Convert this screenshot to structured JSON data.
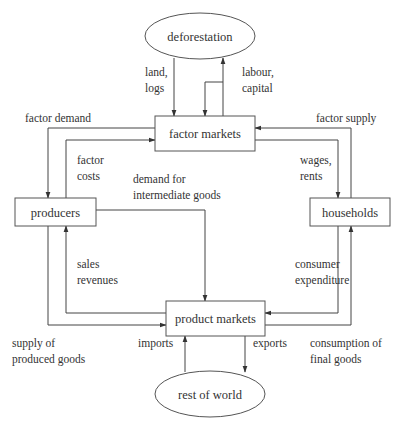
{
  "nodes": {
    "deforestation": {
      "label": "deforestation",
      "shape": "ellipse",
      "cx": 200,
      "cy": 36,
      "rx": 55,
      "ry": 23
    },
    "factor_markets": {
      "label": "factor markets",
      "shape": "rect",
      "x": 155,
      "y": 116,
      "w": 100,
      "h": 35
    },
    "producers": {
      "label": "producers",
      "shape": "rect",
      "x": 15,
      "y": 198,
      "w": 81,
      "h": 28
    },
    "households": {
      "label": "households",
      "shape": "rect",
      "x": 310,
      "y": 198,
      "w": 80,
      "h": 28
    },
    "product_markets": {
      "label": "product markets",
      "shape": "rect",
      "x": 166,
      "y": 301,
      "w": 99,
      "h": 35
    },
    "rest_of_world": {
      "label": "rest of world",
      "shape": "ellipse",
      "cx": 210,
      "cy": 394,
      "rx": 55,
      "ry": 23
    }
  },
  "edges": [
    {
      "id": "land-logs",
      "from": "deforestation",
      "to": "factor_markets",
      "label": [
        "land,",
        "logs"
      ],
      "label_pos": [
        145,
        76
      ],
      "path": [
        [
          174,
          58
        ],
        [
          174,
          116
        ]
      ]
    },
    {
      "id": "labour-capital",
      "from": "factor_markets",
      "to": "deforestation",
      "label": [
        "labour,",
        "capital"
      ],
      "label_pos": [
        242,
        76
      ],
      "path": [
        [
          223,
          116
        ],
        [
          223,
          58
        ]
      ]
    },
    {
      "id": "labour-capital-return",
      "from": "deforestation",
      "to": "factor_markets",
      "label": [],
      "label_pos": [
        0,
        0
      ],
      "path": [
        [
          223,
          82
        ],
        [
          205,
          82
        ],
        [
          205,
          116
        ]
      ]
    },
    {
      "id": "factor-demand",
      "from": "factor_markets",
      "to": "producers",
      "label": [
        "factor demand"
      ],
      "label_pos": [
        25,
        122
      ],
      "path": [
        [
          155,
          128
        ],
        [
          48,
          128
        ],
        [
          48,
          198
        ]
      ]
    },
    {
      "id": "factor-costs",
      "from": "producers",
      "to": "factor_markets",
      "label": [
        "factor",
        "costs"
      ],
      "label_pos": [
        77,
        164
      ],
      "path": [
        [
          66,
          198
        ],
        [
          66,
          140
        ],
        [
          155,
          140
        ]
      ]
    },
    {
      "id": "factor-supply",
      "from": "households",
      "to": "factor_markets",
      "label": [
        "factor supply"
      ],
      "label_pos": [
        316,
        122
      ],
      "path": [
        [
          351,
          198
        ],
        [
          351,
          128
        ],
        [
          255,
          128
        ]
      ]
    },
    {
      "id": "wages-rents",
      "from": "factor_markets",
      "to": "households",
      "label": [
        "wages,",
        "rents"
      ],
      "label_pos": [
        300,
        164
      ],
      "path": [
        [
          255,
          140
        ],
        [
          338,
          140
        ],
        [
          338,
          198
        ]
      ]
    },
    {
      "id": "demand-intermediate-goods",
      "from": "producers",
      "to": "product_markets",
      "label": [
        "demand for",
        "intermediate goods"
      ],
      "label_pos": [
        133,
        183
      ],
      "path": [
        [
          96,
          210
        ],
        [
          205,
          210
        ],
        [
          205,
          301
        ]
      ]
    },
    {
      "id": "sales-revenues",
      "from": "product_markets",
      "to": "producers",
      "label": [
        "sales",
        "revenues"
      ],
      "label_pos": [
        77,
        268
      ],
      "path": [
        [
          166,
          313
        ],
        [
          66,
          313
        ],
        [
          66,
          226
        ]
      ]
    },
    {
      "id": "supply-produced-goods",
      "from": "producers",
      "to": "product_markets",
      "label": [
        "supply of",
        "produced goods"
      ],
      "label_pos": [
        12,
        347
      ],
      "path": [
        [
          48,
          226
        ],
        [
          48,
          325
        ],
        [
          166,
          325
        ]
      ]
    },
    {
      "id": "consumer-expenditure",
      "from": "households",
      "to": "product_markets",
      "label": [
        "consumer",
        "expenditure"
      ],
      "label_pos": [
        295,
        268
      ],
      "path": [
        [
          338,
          226
        ],
        [
          338,
          313
        ],
        [
          265,
          313
        ]
      ]
    },
    {
      "id": "consumption-final-goods",
      "from": "product_markets",
      "to": "households",
      "label": [
        "consumption of",
        "final goods"
      ],
      "label_pos": [
        310,
        347
      ],
      "path": [
        [
          265,
          325
        ],
        [
          351,
          325
        ],
        [
          351,
          226
        ]
      ]
    },
    {
      "id": "imports",
      "from": "rest_of_world",
      "to": "product_markets",
      "label": [
        "imports"
      ],
      "label_pos": [
        138,
        347
      ],
      "path": [
        [
          185,
          372
        ],
        [
          185,
          336
        ]
      ]
    },
    {
      "id": "exports",
      "from": "product_markets",
      "to": "rest_of_world",
      "label": [
        "exports"
      ],
      "label_pos": [
        253,
        347
      ],
      "path": [
        [
          245,
          336
        ],
        [
          245,
          372
        ]
      ]
    }
  ],
  "colors": {
    "stroke": "#444444",
    "text": "#333333",
    "background": "#ffffff"
  }
}
